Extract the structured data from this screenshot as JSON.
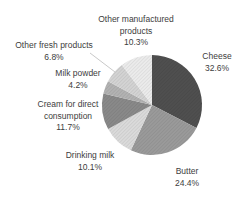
{
  "page": {
    "background_color": "#ffffff",
    "text_color": "#3d3d3d"
  },
  "chart_data": {
    "type": "pie",
    "title": "",
    "unit": "%",
    "start_angle_deg": 0,
    "direction": "clockwise",
    "legend_position": "none",
    "label_style": "direct labels outside slices with percent values",
    "categories": [
      "Cheese",
      "Butter",
      "Drinking milk",
      "Cream for direct consumption",
      "Milk powder",
      "Other fresh products",
      "Other manufactured products"
    ],
    "values": [
      32.6,
      24.4,
      10.1,
      11.7,
      4.2,
      6.8,
      10.3
    ],
    "slices": [
      {
        "name": "Cheese",
        "value": 32.6,
        "pct_text": "32.6%",
        "label_lines": [
          "Cheese"
        ],
        "color": "#4f4f4f",
        "label_cx": 217,
        "label_top": 51
      },
      {
        "name": "Butter",
        "value": 24.4,
        "pct_text": "24.4%",
        "label_lines": [
          "Butter"
        ],
        "color": "#9a9a9a",
        "label_cx": 187,
        "label_top": 166
      },
      {
        "name": "Drinking milk",
        "value": 10.1,
        "pct_text": "10.1%",
        "label_lines": [
          "Drinking milk"
        ],
        "color": "#dadada",
        "label_cx": 90,
        "label_top": 150
      },
      {
        "name": "Cream for direct consumption",
        "value": 11.7,
        "pct_text": "11.7%",
        "label_lines": [
          "Cream for direct",
          "consumption"
        ],
        "color": "#898989",
        "label_cx": 68,
        "label_top": 99
      },
      {
        "name": "Milk powder",
        "value": 4.2,
        "pct_text": "4.2%",
        "label_lines": [
          "Milk powder"
        ],
        "color": "#b2b2b2",
        "label_cx": 78,
        "label_top": 68
      },
      {
        "name": "Other fresh products",
        "value": 6.8,
        "pct_text": "6.8%",
        "label_lines": [
          "Other fresh products"
        ],
        "color": "#d3d3d3",
        "label_cx": 54,
        "label_top": 40,
        "leader": {
          "x1": 90,
          "y1": 53,
          "x2": 115,
          "y2": 72
        }
      },
      {
        "name": "Other manufactured products",
        "value": 10.3,
        "pct_text": "10.3%",
        "label_lines": [
          "Other manufactured",
          "products"
        ],
        "color": "#ebebeb",
        "label_cx": 136,
        "label_top": 14
      }
    ],
    "geometry": {
      "cx": 152,
      "cy": 105,
      "r": 50,
      "canvas_w": 244,
      "canvas_h": 199
    },
    "leader_line_color": "#c9c9c9",
    "hatch_texture": "fine 45-degree diagonal lines over each slice"
  }
}
